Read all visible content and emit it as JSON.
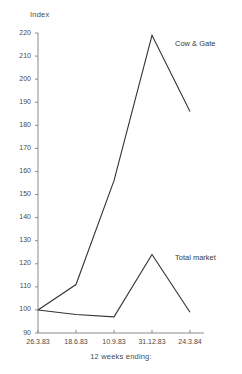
{
  "chart_data": {
    "type": "line",
    "title": "",
    "ylabel": "Index",
    "xlabel": "12 weeks ending:",
    "ylim": [
      90,
      220
    ],
    "ytick_step": 10,
    "yticks": [
      90,
      100,
      110,
      120,
      130,
      140,
      150,
      160,
      170,
      180,
      190,
      200,
      210,
      220
    ],
    "categories": [
      "26.3.83",
      "18.6.83",
      "10.9.83",
      "31.12.83",
      "24.3.84"
    ],
    "grid": false,
    "legend_position": "inline-annotation",
    "series": [
      {
        "name": "Cow & Gate",
        "values": [
          100,
          111,
          156,
          219,
          186
        ],
        "color": "#333333"
      },
      {
        "name": "Total market",
        "values": [
          100,
          98,
          97,
          124,
          99
        ],
        "color": "#333333"
      }
    ],
    "annotations": [
      {
        "text": "Cow & Gate",
        "at_category": "31.12.83"
      },
      {
        "text": "Total market",
        "at_category": "31.12.83"
      }
    ]
  },
  "axes": {
    "y_label_text": "Index",
    "x_caption_text": "12 weeks ending:",
    "y_tick_labels": [
      "220",
      "210",
      "200",
      "190",
      "180",
      "170",
      "160",
      "150",
      "140",
      "130",
      "120",
      "110",
      "100",
      "90"
    ],
    "x_tick_labels": [
      "26.3.83",
      "18.6.83",
      "10.9.83",
      "31.12.83",
      "24.3.84"
    ]
  },
  "style": {
    "axis_color": "#8a8a8a",
    "line_color": "#333333",
    "text_color": "#4a4a4a",
    "background": "#ffffff"
  }
}
